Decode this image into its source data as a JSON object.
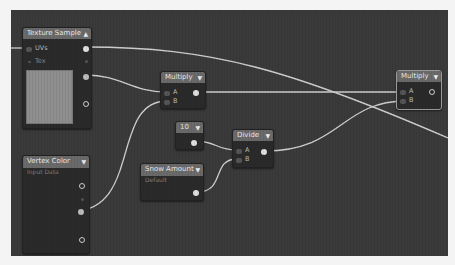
{
  "editor": {
    "background_color": "#3a3a3a",
    "wire_color": "#cfcfcf"
  },
  "nodes": {
    "texture_sample": {
      "title": "Texture Sample",
      "collapse_icon": "▲",
      "inputs": [
        {
          "label": "UVs"
        },
        {
          "label": "Tex"
        }
      ],
      "preview_color": "#8e8e8e"
    },
    "vertex_color": {
      "title": "Vertex Color",
      "subtitle": "Input Data",
      "collapse_icon": "▼"
    },
    "multiply_1": {
      "title": "Multiply",
      "collapse_icon": "▼",
      "inputs": [
        {
          "label": "A"
        },
        {
          "label": "B"
        }
      ]
    },
    "constant_10": {
      "title": "10",
      "collapse_icon": "▼"
    },
    "snow_amount": {
      "title": "Snow Amount",
      "subtitle": "Default",
      "collapse_icon": "▼"
    },
    "divide": {
      "title": "Divide",
      "collapse_icon": "▼",
      "inputs": [
        {
          "label": "A"
        },
        {
          "label": "B"
        }
      ]
    },
    "multiply_2": {
      "title": "Multiply",
      "collapse_icon": "▼",
      "selected": true,
      "inputs": [
        {
          "label": "A"
        },
        {
          "label": "B"
        }
      ]
    }
  }
}
